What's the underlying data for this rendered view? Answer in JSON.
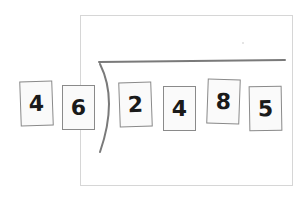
{
  "diagram": {
    "type": "long-division-with-number-cards",
    "divisor_cards": [
      {
        "value": "4",
        "x": 20,
        "y": 81,
        "rotate": -2
      },
      {
        "value": "6",
        "x": 62,
        "y": 85,
        "rotate": 0
      }
    ],
    "dividend_cards": [
      {
        "value": "2",
        "x": 119,
        "y": 82,
        "rotate": -2
      },
      {
        "value": "4",
        "x": 163,
        "y": 86,
        "rotate": 0
      },
      {
        "value": "8",
        "x": 207,
        "y": 79,
        "rotate": 2
      },
      {
        "value": "5",
        "x": 249,
        "y": 86,
        "rotate": -1
      }
    ],
    "colors": {
      "frame_border": "#d6d6d6",
      "card_border": "#8a8a8a",
      "bracket_stroke": "#7a7a7a",
      "digit": "#1a1a1a"
    }
  }
}
